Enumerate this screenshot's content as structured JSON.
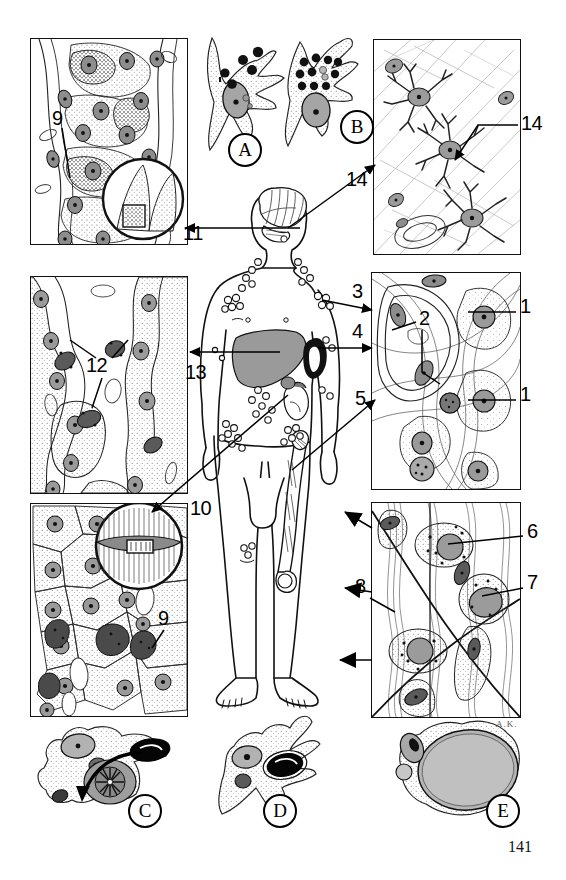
{
  "figure": {
    "page_number": "141",
    "artist_signature": "A.K.",
    "domain": "histology-plate"
  },
  "panels": [
    {
      "id": "panel-top-left",
      "name": "liver-kupffer-panel",
      "x": 30,
      "y": 38,
      "w": 156,
      "h": 205,
      "tint": "#ffffff",
      "description": "Liver parenchyma with Kupffer cells and inset circle"
    },
    {
      "id": "panel-top-right",
      "name": "brain-microglia-panel",
      "x": 373,
      "y": 39,
      "w": 146,
      "h": 214,
      "tint": "#ffffff",
      "description": "Nervous tissue with microglial cells"
    },
    {
      "id": "panel-mid-left",
      "name": "lung-alveolar-panel",
      "x": 30,
      "y": 276,
      "w": 156,
      "h": 216,
      "tint": "#ffffff",
      "description": "Alveolar septa with alveolar macrophages"
    },
    {
      "id": "panel-mid-right",
      "name": "loose-connective-tissue-panel",
      "x": 371,
      "y": 272,
      "w": 148,
      "h": 216,
      "tint": "#ffffff",
      "description": "Loose connective tissue with fibroblasts and mast cells"
    },
    {
      "id": "panel-bot-left",
      "name": "liver-sinusoid-panel",
      "x": 30,
      "y": 503,
      "w": 156,
      "h": 212,
      "tint": "#ffffff",
      "description": "Hepatocytes with sinusoidal macrophages and inset circle"
    },
    {
      "id": "panel-bot-right",
      "name": "tendon-macrophage-panel",
      "x": 371,
      "y": 502,
      "w": 148,
      "h": 214,
      "tint": "#ffffff",
      "description": "Dense connective tissue with macrophages and fibrocytes"
    }
  ],
  "numeric_labels": [
    {
      "num": "1",
      "x": 520,
      "y": 306,
      "name": "label-1-upper",
      "leader": "to-upper-right-cell"
    },
    {
      "num": "1",
      "x": 520,
      "y": 394,
      "name": "label-1-lower",
      "leader": "to-lower-right-cell"
    },
    {
      "num": "2",
      "x": 420,
      "y": 318,
      "name": "label-2",
      "leader": "to-endothelial-nucleus"
    },
    {
      "num": "3",
      "x": 352,
      "y": 290,
      "name": "label-3",
      "leader": "to-lymph-node-axilla"
    },
    {
      "num": "4",
      "x": 352,
      "y": 330,
      "name": "label-4",
      "leader": "to-spleen"
    },
    {
      "num": "5",
      "x": 355,
      "y": 397,
      "name": "label-5",
      "leader": "to-femur-bone-marrow"
    },
    {
      "num": "6",
      "x": 527,
      "y": 530,
      "name": "label-6",
      "leader": "to-macrophage-nucleus"
    },
    {
      "num": "7",
      "x": 527,
      "y": 581,
      "name": "label-7",
      "leader": "to-macrophage-cytoplasm"
    },
    {
      "num": "8",
      "x": 355,
      "y": 585,
      "name": "label-8",
      "leader": "to-connective-tissue-arrows"
    },
    {
      "num": "9",
      "x": 52,
      "y": 117,
      "name": "label-9-top",
      "leader": "to-kupffer-cell"
    },
    {
      "num": "9",
      "x": 158,
      "y": 617,
      "name": "label-9-bottom",
      "leader": "to-sinusoidal-macrophage"
    },
    {
      "num": "10",
      "x": 190,
      "y": 507,
      "name": "label-10",
      "leader": "to-liver-inset"
    },
    {
      "num": "11",
      "x": 183,
      "y": 232,
      "name": "label-11",
      "leader": "to-brain-from-liver"
    },
    {
      "num": "12",
      "x": 88,
      "y": 364,
      "name": "label-12",
      "leader": "to-alveolar-macrophage"
    },
    {
      "num": "13",
      "x": 185,
      "y": 371,
      "name": "label-13",
      "leader": "to-liver-organ"
    },
    {
      "num": "14",
      "x": 348,
      "y": 178,
      "name": "label-14-left",
      "leader": "to-brain-microglia-panel"
    },
    {
      "num": "14",
      "x": 521,
      "y": 122,
      "name": "label-14-right",
      "leader": "to-microglial-cell"
    }
  ],
  "circled_letters": [
    {
      "letter": "A",
      "x": 234,
      "y": 133,
      "name": "circle-label-a",
      "subject": "macrophage-with-ingested-particles"
    },
    {
      "letter": "B",
      "x": 347,
      "y": 110,
      "name": "circle-label-b",
      "subject": "macrophage-with-phagosomes"
    },
    {
      "letter": "C",
      "x": 133,
      "y": 801,
      "name": "circle-label-c",
      "subject": "macrophage-engulfing-erythrocyte"
    },
    {
      "letter": "D",
      "x": 268,
      "y": 801,
      "name": "circle-label-d",
      "subject": "macrophage-with-erythrocyte"
    },
    {
      "letter": "E",
      "x": 491,
      "y": 801,
      "name": "circle-label-e",
      "subject": "macrophage-with-large-vacuole"
    }
  ],
  "free_cells": [
    {
      "id": "cell-a",
      "name": "free-macrophage-a",
      "x": 205,
      "y": 40,
      "w": 70,
      "h": 120
    },
    {
      "id": "cell-b",
      "name": "free-macrophage-b",
      "x": 290,
      "y": 40,
      "w": 72,
      "h": 120
    },
    {
      "id": "cell-c",
      "name": "free-macrophage-c",
      "x": 40,
      "y": 722,
      "w": 110,
      "h": 95
    },
    {
      "id": "cell-d",
      "name": "free-macrophage-d",
      "x": 218,
      "y": 722,
      "w": 100,
      "h": 95
    },
    {
      "id": "cell-e",
      "name": "free-macrophage-e",
      "x": 395,
      "y": 722,
      "w": 115,
      "h": 95
    }
  ],
  "body_figure": {
    "name": "human-body-diagram",
    "x": 195,
    "y": 190,
    "w": 180,
    "h": 500,
    "organs": [
      "brain",
      "cervical-lymph-nodes",
      "axillary-lymph-nodes",
      "liver",
      "spleen",
      "kidney",
      "inguinal-lymph-nodes",
      "femur-bone-marrow",
      "popliteal-lymph-nodes"
    ],
    "liver_fill": "#9a9a9a",
    "spleen_fill": "#111111"
  }
}
